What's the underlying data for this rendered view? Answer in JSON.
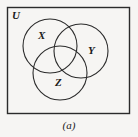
{
  "figure": {
    "type": "venn-diagram",
    "subfigure_caption": "(a)",
    "background_color": "#f6f5f3",
    "stroke_color": "#2b2b2b",
    "universe": {
      "label": "U",
      "shape": "rectangle",
      "x": 7,
      "y": 7,
      "width": 123,
      "height": 107
    },
    "sets": [
      {
        "label": "X",
        "cx": 50,
        "cy": 46,
        "r": 27,
        "label_x": 38,
        "label_y": 30
      },
      {
        "label": "Y",
        "cx": 81,
        "cy": 51,
        "r": 27,
        "label_x": 88,
        "label_y": 45
      },
      {
        "label": "Z",
        "cx": 60,
        "cy": 73,
        "r": 27,
        "label_x": 55,
        "label_y": 77
      }
    ]
  }
}
